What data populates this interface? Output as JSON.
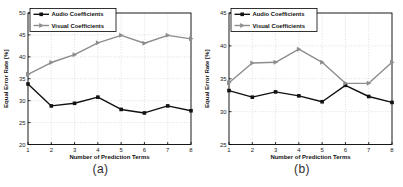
{
  "figure_bg": "#ffffff",
  "chart_data": [
    {
      "type": "line",
      "caption": "(a)",
      "xlabel": "Number of Prediction Terms",
      "ylabel": "Equal Error Rate [%]",
      "x": [
        1,
        2,
        3,
        4,
        5,
        6,
        7,
        8
      ],
      "xlim": [
        1,
        8
      ],
      "ylim": [
        20,
        50
      ],
      "yticks": [
        20,
        25,
        30,
        35,
        40,
        45,
        50
      ],
      "grid": true,
      "legend_position": "top-left",
      "series": [
        {
          "name": "Audio Coefficients",
          "color": "#111111",
          "marker": "square",
          "values": [
            33.8,
            28.8,
            29.4,
            30.8,
            28.0,
            27.2,
            28.8,
            27.7
          ]
        },
        {
          "name": "Visual Coefficients",
          "color": "#8d8d8d",
          "marker": "triangle-right",
          "values": [
            36.0,
            38.7,
            40.5,
            43.2,
            44.9,
            43.1,
            44.9,
            44.1
          ]
        }
      ]
    },
    {
      "type": "line",
      "caption": "(b)",
      "xlabel": "Number of Prediction Terms",
      "ylabel": "Equal Error Rate [%]",
      "x": [
        1,
        2,
        3,
        4,
        5,
        6,
        7,
        8
      ],
      "xlim": [
        1,
        8
      ],
      "ylim": [
        25,
        45
      ],
      "yticks": [
        25,
        30,
        35,
        40,
        45
      ],
      "grid": true,
      "legend_position": "top-left",
      "series": [
        {
          "name": "Audio Coefficients",
          "color": "#111111",
          "marker": "square",
          "values": [
            33.2,
            32.2,
            33.0,
            32.4,
            31.5,
            34.0,
            32.3,
            31.4
          ]
        },
        {
          "name": "Visual Coefficients",
          "color": "#8d8d8d",
          "marker": "triangle-right",
          "values": [
            34.4,
            37.4,
            37.5,
            39.5,
            37.5,
            34.3,
            34.3,
            37.5
          ]
        }
      ]
    }
  ],
  "style": {
    "grid_color": "#c9c9c9",
    "axis_color": "#000000",
    "tick_text_color": "#1a1a1a",
    "label_text_color": "#111111"
  }
}
